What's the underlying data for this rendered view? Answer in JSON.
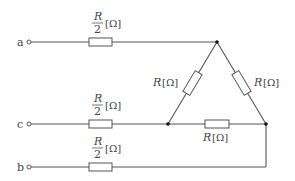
{
  "diagram": {
    "type": "circuit",
    "terminals": [
      {
        "id": "a",
        "label": "a"
      },
      {
        "id": "c",
        "label": "c"
      },
      {
        "id": "b",
        "label": "b"
      }
    ],
    "resistors": [
      {
        "id": "Ra",
        "num": "R",
        "den": "2",
        "unit": "[Ω]"
      },
      {
        "id": "Rc",
        "num": "R",
        "den": "2",
        "unit": "[Ω]"
      },
      {
        "id": "Rb",
        "num": "R",
        "den": "2",
        "unit": "[Ω]"
      },
      {
        "id": "R_left",
        "label": "R",
        "unit": "[Ω]"
      },
      {
        "id": "R_right",
        "label": "R",
        "unit": "[Ω]"
      },
      {
        "id": "R_bottom",
        "label": "R",
        "unit": "[Ω]"
      }
    ]
  }
}
